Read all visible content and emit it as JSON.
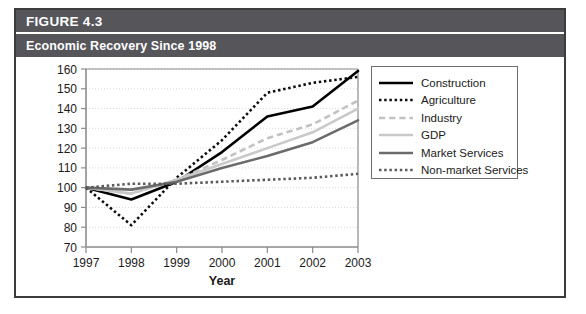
{
  "figure": {
    "number_label": "FIGURE 4.3",
    "caption": "Economic Recovery Since 1998"
  },
  "chart_data": {
    "type": "line",
    "title": "Economic Recovery Since 1998",
    "xlabel": "Year",
    "ylabel": "",
    "categories": [
      "1997",
      "1998",
      "1999",
      "2000",
      "2001",
      "2002",
      "2003"
    ],
    "x": [
      1997,
      1998,
      1999,
      2000,
      2001,
      2002,
      2003
    ],
    "xlim": [
      1997,
      2003
    ],
    "ylim": [
      70,
      160
    ],
    "yticks": [
      70,
      80,
      90,
      100,
      110,
      120,
      130,
      140,
      150,
      160
    ],
    "xticks": [
      "1997",
      "1998",
      "1999",
      "2000",
      "2001",
      "2002",
      "2003"
    ],
    "grid": true,
    "legend_position": "right",
    "series": [
      {
        "name": "Construction",
        "values": [
          100,
          94,
          103,
          118,
          136,
          141,
          159
        ],
        "color": "#000000",
        "style": "solid",
        "width": 2.6
      },
      {
        "name": "Agriculture",
        "values": [
          100,
          81,
          105,
          124,
          148,
          153,
          156
        ],
        "color": "#0d0d0d",
        "style": "dotted",
        "width": 2.6
      },
      {
        "name": "Industry",
        "values": [
          100,
          97,
          104,
          114,
          125,
          132,
          144
        ],
        "color": "#c2c2c2",
        "style": "dashed",
        "width": 2.6
      },
      {
        "name": "GDP",
        "values": [
          100,
          97,
          104,
          112,
          120,
          128,
          140
        ],
        "color": "#c9c9c9",
        "style": "solid",
        "width": 2.6
      },
      {
        "name": "Market Services",
        "values": [
          100,
          99,
          103,
          110,
          116,
          123,
          134
        ],
        "color": "#6b6b6b",
        "style": "solid",
        "width": 2.6
      },
      {
        "name": "Non-market Services",
        "values": [
          100,
          102,
          102,
          103,
          104,
          105,
          107
        ],
        "color": "#5a5a5a",
        "style": "dotted",
        "width": 2.6
      }
    ]
  },
  "colors": {
    "header_bar": "#55555a",
    "frame": "#3c3c3c",
    "axis": "#8c8c8c",
    "grid": "#d9d9d9",
    "text": "#1a1a1a"
  }
}
